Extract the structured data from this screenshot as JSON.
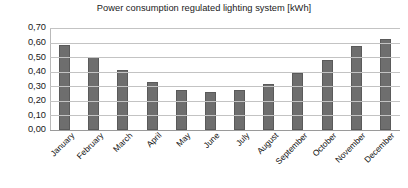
{
  "chart_data": {
    "type": "bar",
    "title": "Power consumption regulated lighting system [kWh]",
    "xlabel": "",
    "ylabel": "",
    "categories": [
      "January",
      "February",
      "March",
      "April",
      "May",
      "June",
      "July",
      "August",
      "September",
      "October",
      "November",
      "December"
    ],
    "values": [
      0.585,
      0.5,
      0.415,
      0.332,
      0.278,
      0.263,
      0.272,
      0.317,
      0.39,
      0.483,
      0.575,
      0.622
    ],
    "series": [
      {
        "name": "Power consumption regulated lighting system [kWh]",
        "values": [
          0.585,
          0.5,
          0.415,
          0.332,
          0.278,
          0.263,
          0.272,
          0.317,
          0.39,
          0.483,
          0.575,
          0.622
        ]
      }
    ],
    "ylim": [
      0.0,
      0.7
    ],
    "ytick_values": [
      0.7,
      0.6,
      0.5,
      0.4,
      0.3,
      0.2,
      0.1,
      0.0
    ],
    "ytick_labels": [
      "0,70",
      "0,60",
      "0,50",
      "0,40",
      "0,30",
      "0,20",
      "0,10",
      "0,00"
    ],
    "grid": true,
    "grid_axis": "y",
    "legend": false,
    "legend_position": "none",
    "xtick_rotation": -45,
    "bar_color": "#6e6e6e",
    "bar_edge_color": "#5a5a5a",
    "gridline_color": "#c3c3c3",
    "axis_color": "#9a9a9a",
    "background_color": "#ffffff",
    "text_color": "#1a1a1a",
    "decimal_separator": ","
  }
}
